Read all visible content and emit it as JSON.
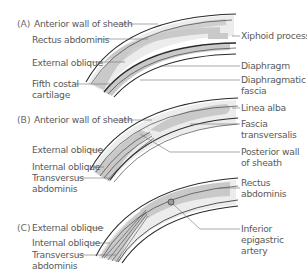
{
  "panels": [
    {
      "tag": "(A)",
      "labels_left": [
        "Anterior wall of sheath",
        "Rectus abdominis",
        "External oblique",
        "Fifth costal",
        "cartilage"
      ],
      "labels_right": [
        "Xiphoid process",
        "Diaphragm",
        "Diaphragmatic",
        "fascia"
      ]
    },
    {
      "tag": "(B)",
      "labels_left": [
        "Anterior wall of sheath",
        "External oblique",
        "Internal oblique",
        "Transversus",
        "abdominis"
      ],
      "labels_right": [
        "Linea alba",
        "Fascia",
        "transversalis",
        "Posterior wall",
        "of sheath"
      ]
    },
    {
      "tag": "(C)",
      "labels_left": [
        "External oblique",
        "Internal oblique",
        "Transversus",
        "abdominis"
      ],
      "labels_right": [
        "Rectus",
        "abdominis",
        "Inferior",
        "epigastric",
        "artery"
      ]
    }
  ],
  "colors": {
    "muscle_fill": "#c9c9c9",
    "sheath_fill": "#ececec",
    "outline": "#2b2b2b",
    "leader": "#6f6f6f",
    "text": "#5a5a5a"
  }
}
